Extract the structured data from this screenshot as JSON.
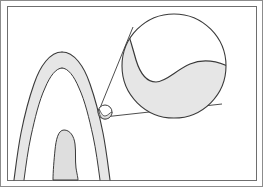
{
  "figure": {
    "title": "Tooth cross-section with magnified detail callout",
    "type": "anatomical-line-diagram",
    "width": 263,
    "height": 187,
    "background_color": "#ffffff",
    "has_text_labels": false,
    "label_text": ""
  },
  "frame": {
    "outer_border_color": "#8c8c8c",
    "outer_border_width": 1,
    "inner_border_color": "#6e6e6e",
    "inner_border_width": 1,
    "inner_rect": {
      "x": 7,
      "y": 6,
      "width": 249,
      "height": 174
    }
  },
  "palette": {
    "stroke": "#3a3a3a",
    "stroke_light": "#555555",
    "fill_shade": "#e6e6e6",
    "fill_shade_dark": "#dedede",
    "fill_white": "#ffffff",
    "page_background": "#ffffff"
  },
  "elements": {
    "tooth": {
      "name": "tooth-cross-section",
      "description": "Longitudinal section of a tooth: pointed crown at top, two diverging roots descending off the bottom edge, enamel/dentin band shaded light gray",
      "crown_apex": {
        "x": 62,
        "y": 52
      },
      "shaded": true
    },
    "pulp_chamber": {
      "name": "pulp-chamber",
      "description": "Central rounded gray shape inside the tooth representing the pulp chamber / root canal",
      "top": {
        "x": 72,
        "y": 130
      },
      "shaded": true
    },
    "detail_marker": {
      "name": "detail-marker-circle",
      "description": "Small circle on the tooth surface marking the region that is magnified",
      "center": {
        "x": 105,
        "y": 112
      },
      "radius": 7
    },
    "magnifier": {
      "name": "magnified-detail-circle",
      "description": "Large circle showing the enlarged view of the marked region: an S-shaped junction curve separating an upper white area from a lower gray shaded area",
      "center": {
        "x": 174,
        "y": 66
      },
      "radius": 52,
      "shaded_region": "lower-left to lower-right crescent"
    },
    "leader_lines": [
      {
        "name": "leader-line-upper",
        "from": {
          "x": 100,
          "y": 108
        },
        "to": {
          "x": 133,
          "y": 27
        }
      },
      {
        "name": "leader-line-lower",
        "from": {
          "x": 104,
          "y": 117
        },
        "to": {
          "x": 222,
          "y": 104
        }
      }
    ]
  },
  "chart_data": {
    "type": "table",
    "title": "Tooth cross-section with magnified detail callout",
    "categories": [
      "tooth-outline",
      "pulp-chamber",
      "detail-marker",
      "magnified-circle",
      "leader-lines"
    ],
    "values": [
      1,
      1,
      1,
      1,
      2
    ]
  }
}
